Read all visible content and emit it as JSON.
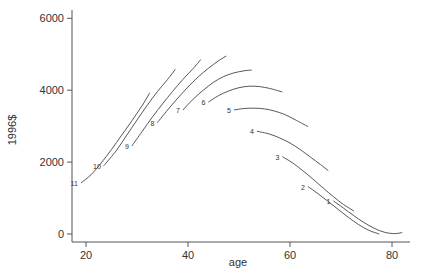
{
  "chart_data": {
    "type": "line",
    "title": "",
    "xlabel": "age",
    "ylabel": "1996$",
    "xlim": [
      17,
      83
    ],
    "ylim": [
      -200,
      6100
    ],
    "x_ticks": [
      20,
      40,
      60,
      80
    ],
    "y_ticks": [
      0,
      2000,
      4000,
      6000
    ],
    "grid": false,
    "legend": "inline numeric labels at start of each curve",
    "series": [
      {
        "name": "11",
        "points": [
          [
            19,
            1420
          ],
          [
            21,
            1650
          ],
          [
            23,
            1980
          ],
          [
            25,
            2350
          ],
          [
            27,
            2750
          ],
          [
            29,
            3150
          ],
          [
            31,
            3570
          ],
          [
            32.5,
            3930
          ]
        ]
      },
      {
        "name": "10",
        "points": [
          [
            23.5,
            1900
          ],
          [
            26,
            2330
          ],
          [
            28,
            2750
          ],
          [
            30,
            3170
          ],
          [
            32,
            3580
          ],
          [
            34,
            3960
          ],
          [
            36,
            4300
          ],
          [
            37.5,
            4580
          ]
        ]
      },
      {
        "name": "9",
        "points": [
          [
            29,
            2450
          ],
          [
            31,
            2850
          ],
          [
            33,
            3250
          ],
          [
            35,
            3620
          ],
          [
            37,
            3970
          ],
          [
            39,
            4300
          ],
          [
            41,
            4600
          ],
          [
            42.5,
            4850
          ]
        ]
      },
      {
        "name": "8",
        "points": [
          [
            34,
            3100
          ],
          [
            36,
            3450
          ],
          [
            38,
            3780
          ],
          [
            40,
            4090
          ],
          [
            42,
            4370
          ],
          [
            44,
            4610
          ],
          [
            46,
            4820
          ],
          [
            47.5,
            4950
          ]
        ]
      },
      {
        "name": "7",
        "points": [
          [
            39,
            3450
          ],
          [
            41,
            3750
          ],
          [
            43,
            4000
          ],
          [
            45,
            4220
          ],
          [
            47,
            4380
          ],
          [
            49,
            4480
          ],
          [
            51,
            4540
          ],
          [
            52.5,
            4560
          ]
        ]
      },
      {
        "name": "6",
        "points": [
          [
            44,
            3670
          ],
          [
            46,
            3850
          ],
          [
            48,
            3980
          ],
          [
            50,
            4070
          ],
          [
            52,
            4110
          ],
          [
            54,
            4100
          ],
          [
            56,
            4050
          ],
          [
            58.5,
            3950
          ]
        ]
      },
      {
        "name": "5",
        "points": [
          [
            49,
            3450
          ],
          [
            51,
            3490
          ],
          [
            53,
            3500
          ],
          [
            55,
            3480
          ],
          [
            57,
            3420
          ],
          [
            59,
            3320
          ],
          [
            61,
            3180
          ],
          [
            63.5,
            2990
          ]
        ]
      },
      {
        "name": "4",
        "points": [
          [
            53.5,
            2860
          ],
          [
            56,
            2780
          ],
          [
            58,
            2670
          ],
          [
            60,
            2530
          ],
          [
            62,
            2350
          ],
          [
            64,
            2140
          ],
          [
            66,
            1930
          ],
          [
            67.5,
            1760
          ]
        ]
      },
      {
        "name": "3",
        "points": [
          [
            58.5,
            2150
          ],
          [
            60.5,
            1980
          ],
          [
            62.5,
            1760
          ],
          [
            64.5,
            1530
          ],
          [
            66.5,
            1280
          ],
          [
            68.5,
            1040
          ],
          [
            70.5,
            820
          ],
          [
            72.5,
            640
          ]
        ]
      },
      {
        "name": "2",
        "points": [
          [
            63.5,
            1320
          ],
          [
            65.5,
            1120
          ],
          [
            67.5,
            900
          ],
          [
            69.5,
            680
          ],
          [
            71.5,
            460
          ],
          [
            73.5,
            260
          ],
          [
            75.5,
            100
          ],
          [
            77.5,
            0
          ]
        ]
      },
      {
        "name": "1",
        "points": [
          [
            68.5,
            920
          ],
          [
            70.5,
            720
          ],
          [
            72.5,
            510
          ],
          [
            74.5,
            320
          ],
          [
            76.5,
            160
          ],
          [
            78.5,
            50
          ],
          [
            80.5,
            10
          ],
          [
            82,
            40
          ]
        ]
      }
    ]
  }
}
